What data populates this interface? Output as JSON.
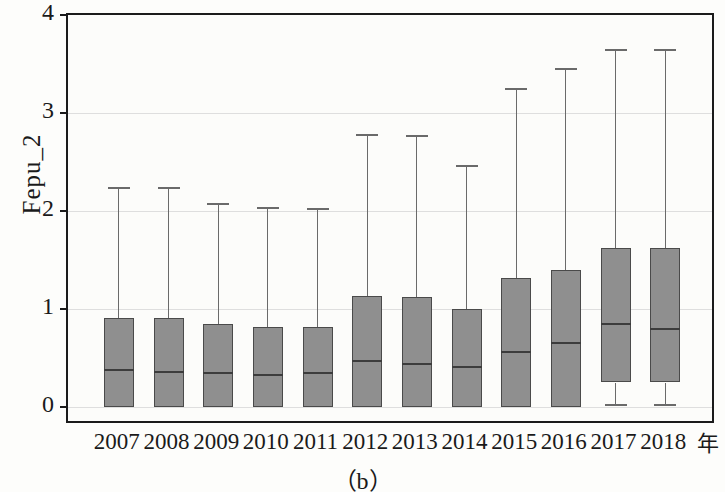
{
  "chart_data": {
    "type": "box",
    "title": "",
    "caption": "（b）",
    "ylabel": "Fepu_2",
    "xlabel": "年",
    "ylim": [
      0,
      4
    ],
    "yticks": [
      0,
      1,
      2,
      3,
      4
    ],
    "ytick_labels": [
      "0",
      "1",
      "2",
      "3",
      "4"
    ],
    "grid": "horizontal",
    "legend": "none",
    "categories": [
      "2007",
      "2008",
      "2009",
      "2010",
      "2011",
      "2012",
      "2013",
      "2014",
      "2015",
      "2016",
      "2017",
      "2018"
    ],
    "boxes": [
      {
        "category": "2007",
        "whisker_low": 0.0,
        "q1": 0.0,
        "median": 0.38,
        "q3": 0.91,
        "whisker_high": 2.25
      },
      {
        "category": "2008",
        "whisker_low": 0.0,
        "q1": 0.0,
        "median": 0.36,
        "q3": 0.91,
        "whisker_high": 2.24
      },
      {
        "category": "2009",
        "whisker_low": 0.0,
        "q1": 0.0,
        "median": 0.35,
        "q3": 0.85,
        "whisker_high": 2.08
      },
      {
        "category": "2010",
        "whisker_low": 0.0,
        "q1": 0.0,
        "median": 0.33,
        "q3": 0.82,
        "whisker_high": 2.04
      },
      {
        "category": "2011",
        "whisker_low": 0.0,
        "q1": 0.0,
        "median": 0.35,
        "q3": 0.82,
        "whisker_high": 2.03
      },
      {
        "category": "2012",
        "whisker_low": 0.0,
        "q1": 0.0,
        "median": 0.47,
        "q3": 1.13,
        "whisker_high": 2.79
      },
      {
        "category": "2013",
        "whisker_low": 0.0,
        "q1": 0.0,
        "median": 0.44,
        "q3": 1.12,
        "whisker_high": 2.78
      },
      {
        "category": "2014",
        "whisker_low": 0.0,
        "q1": 0.0,
        "median": 0.41,
        "q3": 1.0,
        "whisker_high": 2.47
      },
      {
        "category": "2015",
        "whisker_low": 0.0,
        "q1": 0.0,
        "median": 0.56,
        "q3": 1.32,
        "whisker_high": 3.26
      },
      {
        "category": "2016",
        "whisker_low": 0.0,
        "q1": 0.0,
        "median": 0.65,
        "q3": 1.4,
        "whisker_high": 3.46
      },
      {
        "category": "2017",
        "whisker_low": 0.03,
        "q1": 0.25,
        "median": 0.85,
        "q3": 1.62,
        "whisker_high": 3.65
      },
      {
        "category": "2018",
        "whisker_low": 0.03,
        "q1": 0.25,
        "median": 0.8,
        "q3": 1.62,
        "whisker_high": 3.65
      }
    ],
    "colors": {
      "box_fill": "#8f8f8f",
      "box_edge": "#4a4a4a",
      "median_line": "#3c3c3c",
      "whisker": "#6a6a6a",
      "grid": "#dedede",
      "frame": "#1b1b1b",
      "background": "#fcfcfa"
    }
  }
}
